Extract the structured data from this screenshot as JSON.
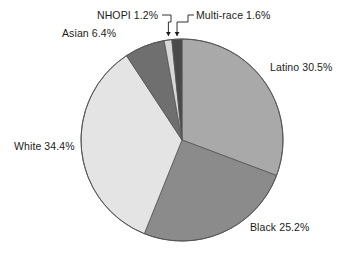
{
  "chart_data": {
    "type": "pie",
    "title": "",
    "subtitle": "",
    "xlabel": "",
    "ylabel": "",
    "legend_position": "none",
    "grid": false,
    "units": "percent",
    "start_angle_deg": 0,
    "direction": "clockwise",
    "categories": [
      "Latino",
      "Black",
      "White",
      "Asian",
      "NHOPI",
      "Multi-race"
    ],
    "values": [
      30.5,
      25.2,
      34.4,
      6.4,
      1.2,
      1.6
    ],
    "total": 99.3,
    "slices": [
      {
        "name": "Latino",
        "value": 30.5,
        "label": "Latino 30.5%",
        "color": "#a9a9a9",
        "label_position": "right",
        "leader_line": false
      },
      {
        "name": "Black",
        "value": 25.2,
        "label": "Black 25.2%",
        "color": "#8b8b8b",
        "label_position": "bottom-right",
        "leader_line": false
      },
      {
        "name": "White",
        "value": 34.4,
        "label": "White 34.4%",
        "color": "#e4e4e4",
        "label_position": "left",
        "leader_line": false
      },
      {
        "name": "Asian",
        "value": 6.4,
        "label": "Asian 6.4%",
        "color": "#6f6f6f",
        "label_position": "top-left",
        "leader_line": false
      },
      {
        "name": "NHOPI",
        "value": 1.2,
        "label": "NHOPI 1.2%",
        "color": "#d8d8d8",
        "label_position": "top",
        "leader_line": true
      },
      {
        "name": "Multi-race",
        "value": 1.6,
        "label": "Multi-race 1.6%",
        "color": "#4a4a4a",
        "label_position": "top",
        "leader_line": true
      }
    ],
    "style": {
      "outline_color": "#555555",
      "background": "#ffffff",
      "text_color": "#1b1b1b"
    }
  }
}
